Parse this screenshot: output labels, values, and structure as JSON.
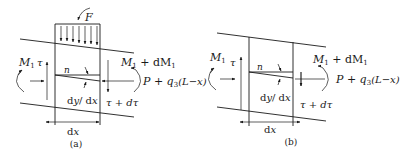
{
  "figure": {
    "panels": [
      {
        "id": "a",
        "caption": "(a)",
        "labels": {
          "force": "F",
          "moment_left": "M",
          "moment_left_sub": "1",
          "shear_left": "τ",
          "neutral": "n",
          "moment_right_prefix": "M",
          "moment_right_sub": "1",
          "moment_right_suffix": " + dM",
          "moment_right_suffix_sub": "1",
          "axial_right": "P + q",
          "axial_right_sub": "3",
          "axial_right_tail": "(L−x)",
          "slope": "dy/dx",
          "shear_right": "τ + dτ",
          "width": "dx"
        },
        "has_distributed_load": true
      },
      {
        "id": "b",
        "caption": "(b)",
        "labels": {
          "moment_left": "M",
          "moment_left_sub": "1",
          "shear_left": "τ",
          "neutral": "n",
          "moment_right_prefix": "M",
          "moment_right_sub": "1",
          "moment_right_suffix": " + dM",
          "moment_right_suffix_sub": "1",
          "axial_right": "P + q",
          "axial_right_sub": "3",
          "axial_right_tail": "(L−x)",
          "slope": "dy/dx",
          "shear_right": "τ + dτ",
          "width": "dx"
        },
        "has_distributed_load": false
      }
    ]
  }
}
